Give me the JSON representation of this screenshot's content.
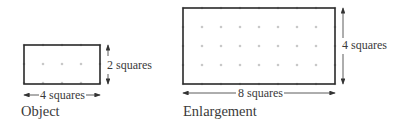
{
  "object": {
    "caption": "Object",
    "width_label": "4 squares",
    "height_label": "2 squares",
    "width_squares": 4,
    "height_squares": 2
  },
  "enlargement": {
    "caption": "Enlargement",
    "width_label": "8 squares",
    "height_label": "4 squares",
    "width_squares": 8,
    "height_squares": 4
  },
  "colors": {
    "outline": "#2a2a2a",
    "dot": "#c8c8c8",
    "text": "#3a3a3a"
  }
}
